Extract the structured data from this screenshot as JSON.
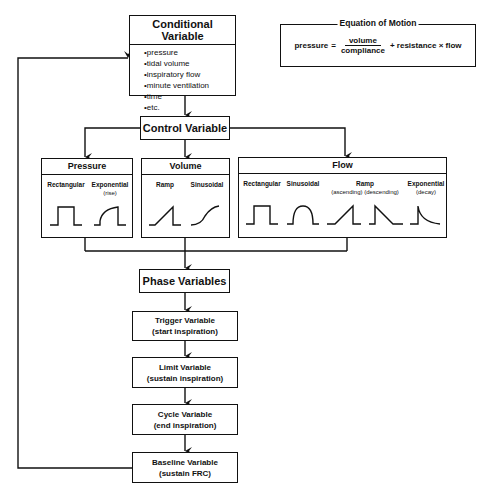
{
  "conditional_variable": {
    "title": "Conditional Variable",
    "items": [
      "pressure",
      "tidal volume",
      "inspiratory flow",
      "minute ventilation",
      "time",
      "etc."
    ]
  },
  "equation_of_motion": {
    "title": "Equation of Motion",
    "lhs": "pressure",
    "equals": "=",
    "numerator": "volume",
    "denominator": "compliance",
    "rhs": "+ resistance × flow"
  },
  "control_variable": {
    "title": "Control Variable"
  },
  "categories": {
    "pressure": {
      "title": "Pressure",
      "waveforms": [
        {
          "label": "Rectangular",
          "sub": "",
          "shape": "rectangular"
        },
        {
          "label": "Exponential",
          "sub": "(rise)",
          "shape": "exponential-rise"
        }
      ]
    },
    "volume": {
      "title": "Volume",
      "waveforms": [
        {
          "label": "Ramp",
          "sub": "",
          "shape": "ramp"
        },
        {
          "label": "Sinusoidal",
          "sub": "",
          "shape": "sinusoidal-s"
        }
      ]
    },
    "flow": {
      "title": "Flow",
      "waveforms": [
        {
          "label": "Rectangular",
          "sub": "",
          "shape": "rectangular"
        },
        {
          "label": "Sinusoidal",
          "sub": "",
          "shape": "sinusoidal-half"
        },
        {
          "label": "Ramp",
          "sub": "(ascending) (descending)",
          "shape": "ramp-ascending-descending"
        },
        {
          "label": "Exponential",
          "sub": "(decay)",
          "shape": "exponential-decay"
        }
      ]
    }
  },
  "phase_variables": {
    "title": "Phase Variables",
    "steps": [
      {
        "name": "Trigger Variable",
        "desc": "(start inspiration)"
      },
      {
        "name": "Limit Variable",
        "desc": "(sustain inspiration)"
      },
      {
        "name": "Cycle Variable",
        "desc": "(end inspiration)"
      },
      {
        "name": "Baseline Variable",
        "desc": "(sustain FRC)"
      }
    ]
  }
}
